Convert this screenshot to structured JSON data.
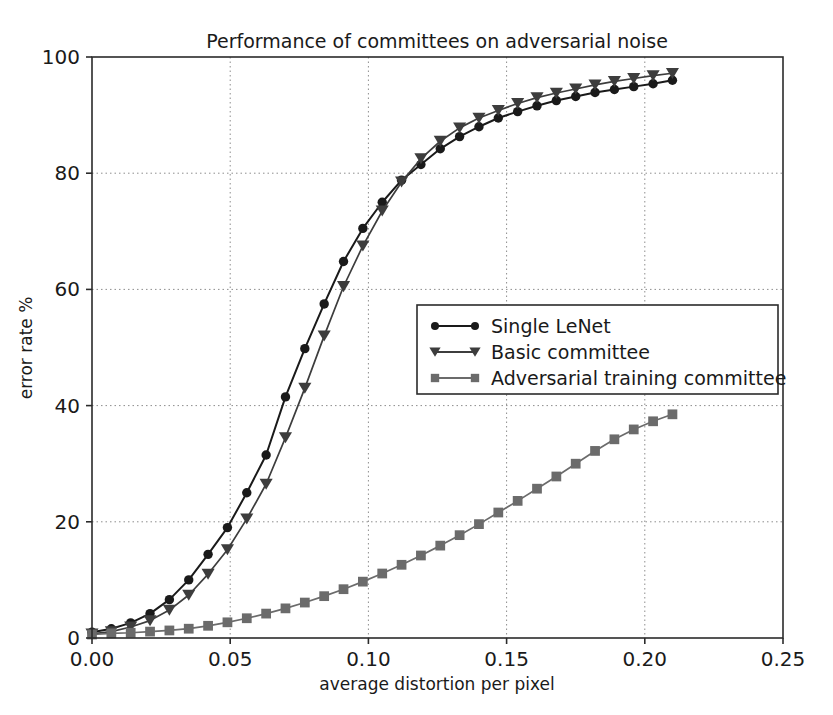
{
  "chart_data": {
    "type": "line",
    "title": "Performance of committees on adversarial noise",
    "xlabel": "average distortion per pixel",
    "ylabel": "error rate %",
    "xlim": [
      0.0,
      0.25
    ],
    "ylim": [
      0,
      100
    ],
    "xticks": [
      "0.00",
      "0.05",
      "0.10",
      "0.15",
      "0.20",
      "0.25"
    ],
    "xtick_values": [
      0.0,
      0.05,
      0.1,
      0.15,
      0.2,
      0.25
    ],
    "yticks": [
      "0",
      "20",
      "40",
      "60",
      "80",
      "100"
    ],
    "ytick_values": [
      0,
      20,
      40,
      60,
      80,
      100
    ],
    "grid": true,
    "grid_style": "dotted",
    "legend_position": "center-right",
    "series": [
      {
        "name": "Single LeNet",
        "marker": "circle",
        "color": "#1a1a1a",
        "x": [
          0.0,
          0.007,
          0.014,
          0.021,
          0.028,
          0.035,
          0.042,
          0.049,
          0.056,
          0.063,
          0.07,
          0.077,
          0.084,
          0.091,
          0.098,
          0.105,
          0.112,
          0.119,
          0.126,
          0.133,
          0.14,
          0.147,
          0.154,
          0.161,
          0.168,
          0.175,
          0.182,
          0.189,
          0.196,
          0.203,
          0.21
        ],
        "values": [
          1.0,
          1.6,
          2.6,
          4.2,
          6.6,
          10.0,
          14.4,
          19.0,
          25.0,
          31.5,
          41.5,
          49.8,
          57.5,
          64.8,
          70.5,
          75.0,
          78.8,
          81.5,
          84.2,
          86.3,
          88.0,
          89.5,
          90.6,
          91.6,
          92.5,
          93.2,
          93.9,
          94.4,
          94.9,
          95.4,
          96.0
        ]
      },
      {
        "name": "Basic committee",
        "marker": "triangle-down",
        "color": "#3d3d3d",
        "x": [
          0.0,
          0.007,
          0.014,
          0.021,
          0.028,
          0.035,
          0.042,
          0.049,
          0.056,
          0.063,
          0.07,
          0.077,
          0.084,
          0.091,
          0.098,
          0.105,
          0.112,
          0.119,
          0.126,
          0.133,
          0.14,
          0.147,
          0.154,
          0.161,
          0.168,
          0.175,
          0.182,
          0.189,
          0.196,
          0.203,
          0.21
        ],
        "values": [
          0.7,
          1.1,
          1.9,
          3.0,
          4.8,
          7.4,
          11.0,
          15.2,
          20.5,
          26.5,
          34.5,
          43.0,
          52.0,
          60.5,
          67.5,
          73.5,
          78.5,
          82.5,
          85.5,
          87.8,
          89.5,
          90.8,
          92.0,
          93.0,
          93.8,
          94.5,
          95.2,
          95.8,
          96.3,
          96.8,
          97.2
        ]
      },
      {
        "name": "Adversarial training committee",
        "marker": "square",
        "color": "#6b6b6b",
        "x": [
          0.0,
          0.007,
          0.014,
          0.021,
          0.028,
          0.035,
          0.042,
          0.049,
          0.056,
          0.063,
          0.07,
          0.077,
          0.084,
          0.091,
          0.098,
          0.105,
          0.112,
          0.119,
          0.126,
          0.133,
          0.14,
          0.147,
          0.154,
          0.161,
          0.168,
          0.175,
          0.182,
          0.189,
          0.196,
          0.203,
          0.21
        ],
        "values": [
          0.6,
          0.8,
          0.9,
          1.1,
          1.3,
          1.6,
          2.1,
          2.7,
          3.4,
          4.2,
          5.1,
          6.1,
          7.2,
          8.4,
          9.7,
          11.1,
          12.6,
          14.2,
          15.9,
          17.7,
          19.6,
          21.6,
          23.6,
          25.7,
          27.8,
          30.0,
          32.2,
          34.2,
          35.9,
          37.3,
          38.5
        ]
      }
    ]
  },
  "plot": {
    "left": 92,
    "right": 783,
    "top": 57,
    "bottom": 638
  }
}
